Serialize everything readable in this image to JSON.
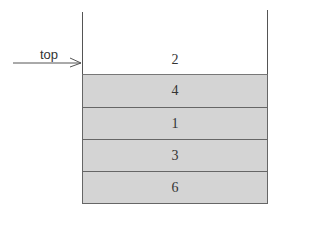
{
  "diagram": {
    "pointer_label": "top",
    "top_value": "2",
    "stack_items": [
      "4",
      "1",
      "3",
      "6"
    ],
    "colors": {
      "cell_fill": "#d4d4d4",
      "line": "#555555"
    }
  }
}
